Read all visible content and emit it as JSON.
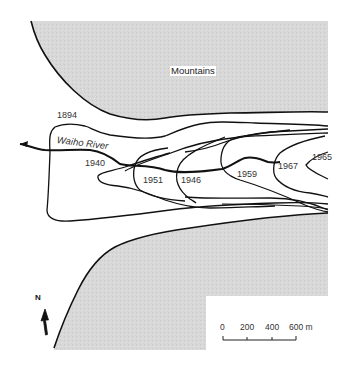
{
  "map": {
    "regions": {
      "mountains_label": "Mountains"
    },
    "river": {
      "name": "Waiho River"
    },
    "ice_margin_years": [
      "1894",
      "1940",
      "1951",
      "1946",
      "1959",
      "1967",
      "1965"
    ],
    "north_arrow": {
      "label": "N"
    },
    "scale_bar": {
      "ticks": [
        "0",
        "200",
        "400",
        "600 m"
      ]
    },
    "colors": {
      "mountain_fill": "#d9d9d9",
      "line": "#111111",
      "background": "#ffffff"
    }
  }
}
